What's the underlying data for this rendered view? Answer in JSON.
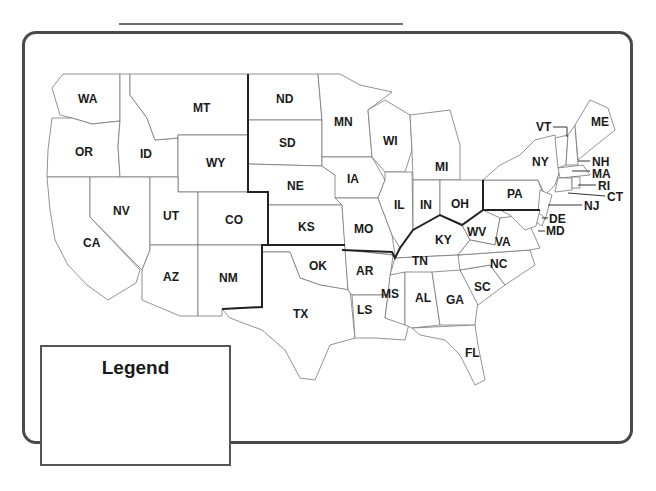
{
  "title_line": "",
  "legend": {
    "title": "Legend"
  },
  "states": {
    "WA": "WA",
    "OR": "OR",
    "CA": "CA",
    "ID": "ID",
    "NV": "NV",
    "MT": "MT",
    "WY": "WY",
    "UT": "UT",
    "CO": "CO",
    "AZ": "AZ",
    "NM": "NM",
    "ND": "ND",
    "SD": "SD",
    "NE": "NE",
    "KS": "KS",
    "OK": "OK",
    "TX": "TX",
    "MN": "MN",
    "IA": "IA",
    "MO": "MO",
    "AR": "AR",
    "LS": "LS",
    "WI": "WI",
    "IL": "IL",
    "MI": "MI",
    "IN": "IN",
    "OH": "OH",
    "KY": "KY",
    "TN": "TN",
    "MS": "MS",
    "AL": "AL",
    "GA": "GA",
    "FL": "FL",
    "SC": "SC",
    "NC": "NC",
    "VA": "VA",
    "WV": "WV",
    "PA": "PA",
    "NY": "NY",
    "VT": "VT",
    "ME": "ME",
    "NH": "NH",
    "MA": "MA",
    "RI": "RI",
    "CT": "CT",
    "NJ": "NJ",
    "DE": "DE",
    "MD": "MD"
  },
  "colors": {
    "frame": "#4a4a4a",
    "borders": "#555555",
    "region_line": "#222222"
  }
}
